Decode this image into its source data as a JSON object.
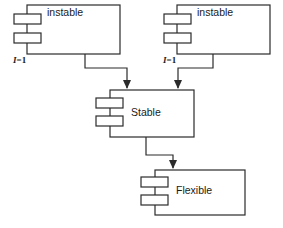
{
  "diagram": {
    "type": "uml-component-diagram",
    "background_color": "#ffffff",
    "line_color": "#2b2b2b",
    "fill_color": "#ffffff",
    "width": 283,
    "height": 228,
    "components": [
      {
        "id": "instable-left",
        "label": "instable",
        "interface_label_prefix": "I",
        "interface_label_suffix": "=1",
        "x": 27,
        "y": 5,
        "width": 93,
        "height": 49
      },
      {
        "id": "instable-right",
        "label": "instable",
        "interface_label_prefix": "I",
        "interface_label_suffix": "=1",
        "x": 177,
        "y": 5,
        "width": 93,
        "height": 49
      },
      {
        "id": "stable",
        "label": "Stable",
        "x": 110,
        "y": 90,
        "width": 84,
        "height": 47
      },
      {
        "id": "flexible",
        "label": "Flexible",
        "x": 155,
        "y": 170,
        "width": 90,
        "height": 45
      }
    ],
    "connectors": [
      {
        "id": "left-instable-to-stable",
        "from": "instable-left",
        "to": "stable",
        "arrow": "open-filled",
        "points": "85,54 85,68 127,68 127,88"
      },
      {
        "id": "right-instable-to-stable",
        "from": "instable-right",
        "to": "stable",
        "arrow": "open-filled",
        "points": "213,54 213,68 178,68 178,88"
      },
      {
        "id": "stable-to-flexible",
        "from": "stable",
        "to": "flexible",
        "arrow": "open-filled",
        "points": "146,137 146,155 173,155 173,168"
      }
    ]
  }
}
